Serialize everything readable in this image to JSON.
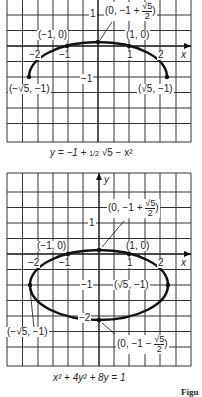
{
  "figure_label": "Figu",
  "graphs": [
    {
      "caption": "y = −1 + ½ √(5 − x²)",
      "caption_parts": {
        "lhs": "y = −1 + ",
        "half": "1/2",
        "root": "√5 − x²"
      },
      "x_axis_label": "x",
      "x_ticks": [
        "−2",
        "−1",
        "1",
        "2"
      ],
      "y_ticks": [
        "1",
        "−1"
      ],
      "points": [
        {
          "label": "(−1, 0)"
        },
        {
          "label": "(1, 0)"
        },
        {
          "label_prefix": "(0, −1 + ",
          "frac_num": "√5",
          "frac_den": "2",
          "label_suffix": ")"
        },
        {
          "label": "(−√5, −1)"
        },
        {
          "label": "(√5, −1)"
        }
      ]
    },
    {
      "caption": "x² + 4y² + 8y = 1",
      "x_axis_label": "x",
      "y_axis_label": "y",
      "x_ticks": [
        "−2",
        "−1",
        "1",
        "2"
      ],
      "y_ticks": [
        "1",
        "−1",
        "−2"
      ],
      "points": [
        {
          "label": "(−1, 0)"
        },
        {
          "label": "(1, 0)"
        },
        {
          "label_prefix": "(0, −1 + ",
          "frac_num": "√5",
          "frac_den": "2",
          "label_suffix": ")"
        },
        {
          "label": "(√5, −1)"
        },
        {
          "label": "(−√5, −1)"
        },
        {
          "label_prefix": "(0, −1 − ",
          "frac_num": "√5",
          "frac_den": "2",
          "label_suffix": ")"
        }
      ]
    }
  ]
}
